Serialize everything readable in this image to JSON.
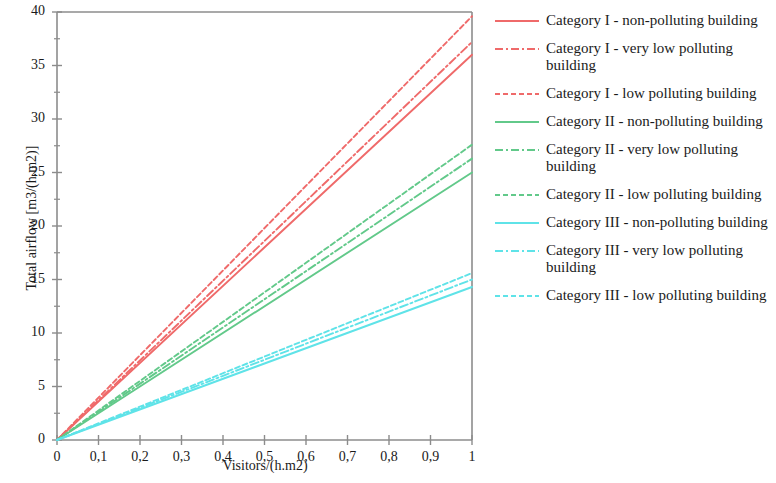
{
  "chart": {
    "type": "line",
    "title": "",
    "xlabel": "Visitors/(h.m2)",
    "ylabel": "Total airflow [m3/(h.m2)]",
    "xlim": [
      0,
      1
    ],
    "ylim": [
      0,
      40
    ],
    "xticks": [
      "0",
      "0,1",
      "0,2",
      "0,3",
      "0,4",
      "0,5",
      "0,6",
      "0,7",
      "0,8",
      "0,9",
      "1"
    ],
    "xtick_values": [
      0,
      0.1,
      0.2,
      0.3,
      0.4,
      0.5,
      0.6,
      0.7,
      0.8,
      0.9,
      1
    ],
    "yticks": [
      "0",
      "5",
      "10",
      "15",
      "20",
      "25",
      "30",
      "35",
      "40"
    ],
    "ytick_values": [
      0,
      5,
      10,
      15,
      20,
      25,
      30,
      35,
      40
    ],
    "yminor_values": [
      2.5,
      7.5,
      12.5,
      17.5,
      22.5,
      27.5,
      32.5,
      37.5
    ],
    "grid": false,
    "legend_position": "right",
    "x": [
      0,
      1
    ],
    "series": [
      {
        "name": "Category I - non-polluting building",
        "color": "#ef6a6a",
        "dash": "solid",
        "values": [
          0,
          36.0
        ]
      },
      {
        "name": "Category I - very low polluting building",
        "color": "#ef6a6a",
        "dash": "dashdot",
        "values": [
          0,
          37.2
        ]
      },
      {
        "name": "Category I - low polluting building",
        "color": "#ef6a6a",
        "dash": "dashed",
        "values": [
          0,
          39.6
        ]
      },
      {
        "name": "Category II - non-polluting building",
        "color": "#62c98a",
        "dash": "solid",
        "values": [
          0,
          25.0
        ]
      },
      {
        "name": "Category II - very low polluting building",
        "color": "#62c98a",
        "dash": "dashdot",
        "values": [
          0,
          26.3
        ]
      },
      {
        "name": "Category II - low polluting building",
        "color": "#62c98a",
        "dash": "dashed",
        "values": [
          0,
          27.6
        ]
      },
      {
        "name": "Category III - non-polluting building",
        "color": "#5fe3e8",
        "dash": "solid",
        "values": [
          0,
          14.3
        ]
      },
      {
        "name": "Category III - very low polluting building",
        "color": "#5fe3e8",
        "dash": "dashdot",
        "values": [
          0,
          15.0
        ]
      },
      {
        "name": "Category III - low polluting building",
        "color": "#5fe3e8",
        "dash": "dashed",
        "values": [
          0,
          15.6
        ]
      }
    ]
  },
  "legend": {
    "items": [
      {
        "label": "Category I - non-polluting building"
      },
      {
        "label": "Category I - very low polluting building"
      },
      {
        "label": "Category I - low polluting building"
      },
      {
        "label": "Category II - non-polluting building"
      },
      {
        "label": "Category II - very low polluting building"
      },
      {
        "label": "Category II - low polluting building"
      },
      {
        "label": "Category III - non-polluting building"
      },
      {
        "label": "Category III - very low polluting building"
      },
      {
        "label": "Category III - low polluting building"
      }
    ]
  }
}
